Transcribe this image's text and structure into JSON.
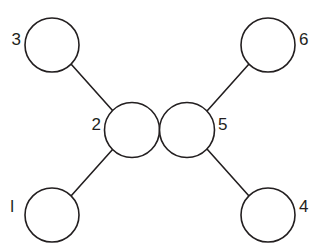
{
  "diagram": {
    "type": "node-link-graph",
    "background_color": "#ffffff",
    "stroke_color": "#231f20",
    "node_fill": "#ffffff",
    "nodes": [
      {
        "id": "n1",
        "label": "l",
        "cx": 52,
        "cy": 215,
        "r": 27,
        "label_x": 14,
        "label_y": 208,
        "label_side": "left"
      },
      {
        "id": "n2",
        "label": "2",
        "cx": 132,
        "cy": 130,
        "r": 27.5,
        "label_x": 101,
        "label_y": 126,
        "label_side": "left"
      },
      {
        "id": "n3",
        "label": "3",
        "cx": 52,
        "cy": 45,
        "r": 27,
        "label_x": 21,
        "label_y": 41,
        "label_side": "left"
      },
      {
        "id": "n4",
        "label": "4",
        "cx": 268,
        "cy": 215,
        "r": 27,
        "label_x": 299,
        "label_y": 208,
        "label_side": "right"
      },
      {
        "id": "n5",
        "label": "5",
        "cx": 187,
        "cy": 130,
        "r": 27.5,
        "label_x": 218,
        "label_y": 126,
        "label_side": "right"
      },
      {
        "id": "n6",
        "label": "6",
        "cx": 268,
        "cy": 45,
        "r": 27,
        "label_x": 299,
        "label_y": 41,
        "label_side": "right"
      }
    ],
    "edges": [
      {
        "id": "e3-2",
        "from": "n3",
        "to": "n2",
        "x1": 71,
        "y1": 64,
        "x2": 113,
        "y2": 111
      },
      {
        "id": "e1-2",
        "from": "n1",
        "to": "n2",
        "x1": 71,
        "y1": 196,
        "x2": 113,
        "y2": 149
      },
      {
        "id": "e6-5",
        "from": "n6",
        "to": "n5",
        "x1": 249,
        "y1": 64,
        "x2": 207,
        "y2": 111
      },
      {
        "id": "e4-5",
        "from": "n4",
        "to": "n5",
        "x1": 249,
        "y1": 196,
        "x2": 207,
        "y2": 149
      }
    ]
  }
}
